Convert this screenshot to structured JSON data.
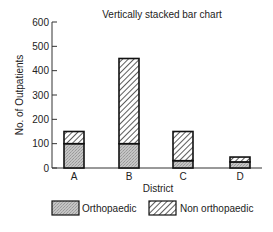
{
  "chart_data": {
    "type": "bar",
    "stacked": true,
    "title": "Vertically stacked bar chart",
    "xlabel": "District",
    "ylabel": "No. of Outpatients",
    "ylim": [
      0,
      600
    ],
    "yticks": [
      0,
      100,
      200,
      300,
      400,
      500,
      600
    ],
    "categories": [
      "A",
      "B",
      "C",
      "D"
    ],
    "series": [
      {
        "name": "Orthopaedic",
        "pattern": "stipple",
        "values": [
          100,
          100,
          30,
          25
        ]
      },
      {
        "name": "Non orthopaedic",
        "pattern": "diagonal-hatch",
        "values": [
          50,
          350,
          120,
          20
        ]
      }
    ],
    "legend_position": "bottom",
    "grid": false
  },
  "colors": {
    "axis": "#333333",
    "stipple_fill": "#b8b8b8",
    "hatch_stroke": "#333333",
    "bar_outline": "#111111"
  }
}
